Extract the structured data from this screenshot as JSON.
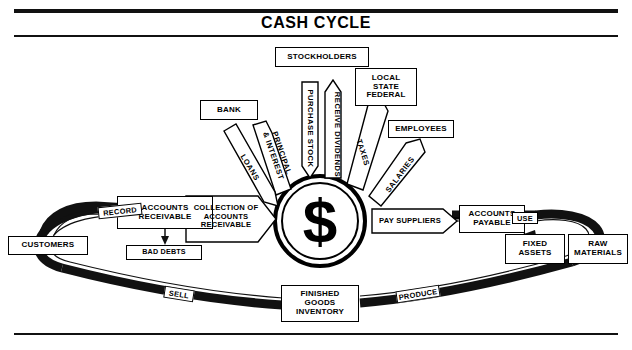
{
  "title": "CASH CYCLE",
  "center": {
    "symbol": "$",
    "name": "cash"
  },
  "colors": {
    "ink": "#000000",
    "paper": "#ffffff",
    "band": "#111111"
  },
  "nodes": {
    "stockholders": "STOCKHOLDERS",
    "bank": "BANK",
    "government": "LOCAL\nSTATE\nFEDERAL",
    "government_line1": "LOCAL",
    "government_line2": "STATE",
    "government_line3": "FEDERAL",
    "employees": "EMPLOYEES",
    "customers": "CUSTOMERS",
    "accounts_receivable_l1": "ACCOUNTS",
    "accounts_receivable_l2": "RECEIVABLE",
    "bad_debts": "BAD DEBTS",
    "accounts_payable_l1": "ACCOUNTS",
    "accounts_payable_l2": "PAYABLE",
    "fixed_assets_l1": "FIXED",
    "fixed_assets_l2": "ASSETS",
    "raw_materials_l1": "RAW",
    "raw_materials_l2": "MATERIALS",
    "finished_goods_l1": "FINISHED",
    "finished_goods_l2": "GOODS",
    "finished_goods_l3": "INVENTORY"
  },
  "flows": {
    "purchase_stock": "PURCHASE STOCK",
    "receive_dividends": "RECEIVE DIVIDENDS",
    "loans": "LOANS",
    "principal_interest_l1": "PRINCIPAL",
    "principal_interest_l2": "& INTEREST",
    "taxes": "TAXES",
    "salaries": "SALARIES",
    "collection_l1": "COLLECTION OF",
    "collection_l2": "ACCOUNTS",
    "collection_l3": "RECEIVABLE",
    "pay_suppliers": "PAY SUPPLIERS",
    "record": "RECORD",
    "use": "USE",
    "sell": "SELL",
    "produce": "PRODUCE"
  }
}
